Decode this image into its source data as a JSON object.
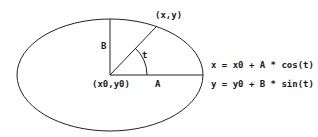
{
  "diagram": {
    "labels": {
      "point": "(x,y)",
      "center": "(x0,y0)",
      "semi_minor": "B",
      "semi_major": "A",
      "angle": "t"
    },
    "equations": [
      "x = x0 + A * cos(t)",
      "y = y0 + B * sin(t)"
    ],
    "colors": {
      "stroke": "#222222",
      "background": "#ffffff"
    }
  }
}
